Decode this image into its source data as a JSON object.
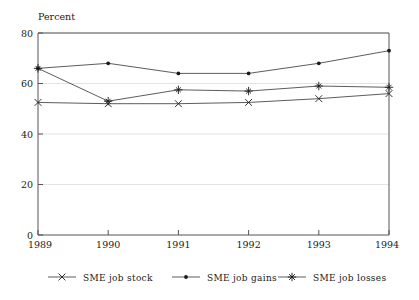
{
  "chart_data": {
    "type": "line",
    "title": "",
    "ylabel": "Percent",
    "xlabel": "",
    "categories": [
      "1989",
      "1990",
      "1991",
      "1992",
      "1993",
      "1994"
    ],
    "x": [
      1989,
      1990,
      1991,
      1992,
      1993,
      1994
    ],
    "ylim": [
      0,
      80
    ],
    "yticks": [
      0,
      20,
      40,
      60,
      80
    ],
    "ytick_labels": [
      "0",
      "20",
      "40",
      "60",
      "80"
    ],
    "grid": true,
    "legend_position": "bottom",
    "series": [
      {
        "name": "SME job stock",
        "marker": "x",
        "values": [
          52.5,
          52,
          52,
          52.5,
          54,
          56
        ]
      },
      {
        "name": "SME job gains",
        "marker": "dot",
        "values": [
          66,
          68,
          64,
          64,
          68,
          73
        ]
      },
      {
        "name": "SME job losses",
        "marker": "star",
        "values": [
          66,
          53,
          57.5,
          57,
          59,
          58.5
        ]
      }
    ]
  },
  "axis": {
    "y_title": "Percent",
    "y_tick_0": "0",
    "y_tick_20": "20",
    "y_tick_40": "40",
    "y_tick_60": "60",
    "y_tick_80": "80",
    "x_tick_1989": "1989",
    "x_tick_1990": "1990",
    "x_tick_1991": "1991",
    "x_tick_1992": "1992",
    "x_tick_1993": "1993",
    "x_tick_1994": "1994"
  },
  "legend": {
    "items": [
      {
        "label": "SME job stock",
        "marker": "x"
      },
      {
        "label": "SME job gains",
        "marker": "dot"
      },
      {
        "label": "SME job losses",
        "marker": "star"
      }
    ]
  },
  "colors": {
    "line": "#4a4a4a",
    "marker": "#1a1a1a",
    "grid": "#dcdcdc",
    "axis": "#555555",
    "text": "#1a1a1a",
    "background": "#ffffff"
  }
}
